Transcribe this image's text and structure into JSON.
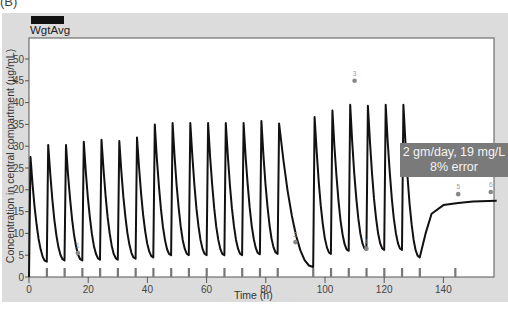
{
  "panel_label": "(B)",
  "legend": {
    "label": "WgtAvg",
    "color": "#111111"
  },
  "annotation": {
    "line1": "2 gm/day, 19 mg/L",
    "line2": "8% error"
  },
  "chart_data": {
    "type": "line",
    "title": "",
    "xlabel": "Time (h)",
    "ylabel": "Concentration in central compartment (µg/mL)",
    "xlim": [
      0,
      158
    ],
    "ylim": [
      0,
      55
    ],
    "x_ticks": [
      0,
      20,
      40,
      60,
      80,
      100,
      120,
      140
    ],
    "y_ticks": [
      0,
      5,
      10,
      15,
      20,
      25,
      30,
      35,
      40,
      45,
      50
    ],
    "grid": false,
    "legend_position": "top-left",
    "dose_times_h": [
      0,
      6,
      12,
      18,
      24,
      30,
      36,
      42,
      48,
      54,
      60,
      66,
      72,
      78,
      84,
      96,
      102,
      108,
      114,
      120,
      126,
      132,
      144
    ],
    "series": [
      {
        "name": "WgtAvg",
        "peaks": [
          {
            "t": 0.5,
            "c": 27.5
          },
          {
            "t": 6.5,
            "c": 30.3
          },
          {
            "t": 12.5,
            "c": 30.3
          },
          {
            "t": 18.5,
            "c": 31
          },
          {
            "t": 24.5,
            "c": 31.5
          },
          {
            "t": 30.5,
            "c": 31.2
          },
          {
            "t": 36.5,
            "c": 32
          },
          {
            "t": 42.5,
            "c": 35
          },
          {
            "t": 48.5,
            "c": 35.3
          },
          {
            "t": 54.5,
            "c": 35.3
          },
          {
            "t": 60.5,
            "c": 35.3
          },
          {
            "t": 66.5,
            "c": 35.3
          },
          {
            "t": 72.5,
            "c": 35.3
          },
          {
            "t": 78.5,
            "c": 35.8
          },
          {
            "t": 84.5,
            "c": 35.2
          },
          {
            "t": 96.5,
            "c": 36.7
          },
          {
            "t": 102.5,
            "c": 38.2
          },
          {
            "t": 108.5,
            "c": 39.5
          },
          {
            "t": 114.5,
            "c": 39.3
          },
          {
            "t": 120.5,
            "c": 39.5
          },
          {
            "t": 126.5,
            "c": 39.5
          }
        ],
        "troughs": [
          {
            "t": 6,
            "c": 3.5
          },
          {
            "t": 12,
            "c": 3.8
          },
          {
            "t": 18,
            "c": 3.8
          },
          {
            "t": 24,
            "c": 4
          },
          {
            "t": 30,
            "c": 4
          },
          {
            "t": 36,
            "c": 4.2
          },
          {
            "t": 42,
            "c": 4.5
          },
          {
            "t": 48,
            "c": 5
          },
          {
            "t": 54,
            "c": 5
          },
          {
            "t": 60,
            "c": 5
          },
          {
            "t": 66,
            "c": 5
          },
          {
            "t": 72,
            "c": 5
          },
          {
            "t": 78,
            "c": 5.2
          },
          {
            "t": 84,
            "c": 5.3
          },
          {
            "t": 96,
            "c": 2.3
          },
          {
            "t": 102,
            "c": 5.3
          },
          {
            "t": 108,
            "c": 6
          },
          {
            "t": 114,
            "c": 6.2
          },
          {
            "t": 120,
            "c": 6.2
          },
          {
            "t": 126,
            "c": 6.2
          },
          {
            "t": 132,
            "c": 4.5
          }
        ],
        "tail": [
          {
            "t": 132,
            "c": 4.5
          },
          {
            "t": 134,
            "c": 10
          },
          {
            "t": 136,
            "c": 14.5
          },
          {
            "t": 140,
            "c": 16.5
          },
          {
            "t": 145,
            "c": 17
          },
          {
            "t": 150,
            "c": 17.3
          },
          {
            "t": 158,
            "c": 17.5
          }
        ]
      }
    ],
    "observed_points": [
      {
        "label": "1",
        "t": 16.5,
        "c": 5.5
      },
      {
        "label": "2",
        "t": 90,
        "c": 8
      },
      {
        "label": "3",
        "t": 110,
        "c": 45
      },
      {
        "label": "4",
        "t": 114,
        "c": 6.5
      },
      {
        "label": "5",
        "t": 145,
        "c": 19
      },
      {
        "label": "6",
        "t": 156,
        "c": 19.5
      }
    ]
  }
}
